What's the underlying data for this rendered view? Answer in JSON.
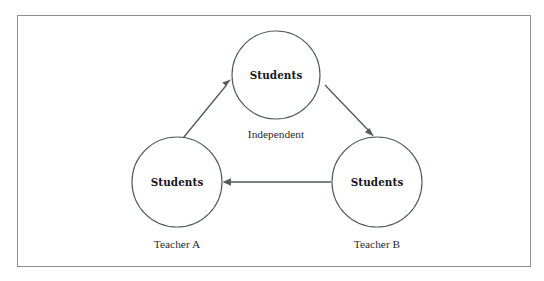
{
  "figure": {
    "type": "diagram",
    "frame": {
      "border_color": "#8e8e8e",
      "background_color": "#ffffff"
    },
    "stroke_color": "#54595d",
    "text_color": "#17181a"
  },
  "nodes": [
    {
      "id": "top",
      "label": "Students",
      "caption": "Independent",
      "cx": 276,
      "cy": 75,
      "r": 44
    },
    {
      "id": "left",
      "label": "Students",
      "caption": "Teacher A",
      "cx": 177,
      "cy": 182,
      "r": 45
    },
    {
      "id": "right",
      "label": "Students",
      "caption": "Teacher B",
      "cx": 377,
      "cy": 182,
      "r": 45
    }
  ],
  "arrows": [
    {
      "id": "left-to-top",
      "from": "left",
      "to": "top",
      "direction": "up-right",
      "label": ""
    },
    {
      "id": "top-to-right",
      "from": "top",
      "to": "right",
      "direction": "down-right",
      "label": ""
    },
    {
      "id": "right-to-left",
      "from": "right",
      "to": "left",
      "direction": "left",
      "label": ""
    }
  ]
}
